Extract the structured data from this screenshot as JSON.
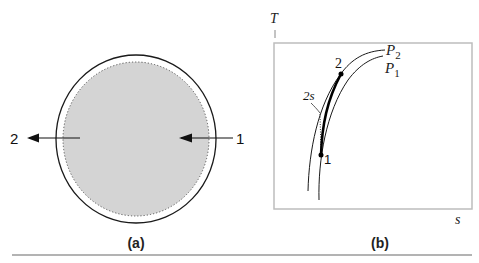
{
  "panel_a": {
    "caption": "(a)",
    "inlet_label": "1",
    "outlet_label": "2",
    "fill_color": "#d4d4d4",
    "stroke_color": "#1a1a1a"
  },
  "panel_b": {
    "caption": "(b)",
    "y_axis_label": "T",
    "x_axis_label": "s",
    "curves": [
      {
        "name": "P2",
        "main": "P",
        "sub": "2"
      },
      {
        "name": "P1",
        "main": "P",
        "sub": "1"
      }
    ],
    "points": [
      {
        "label": "1"
      },
      {
        "label": "2"
      },
      {
        "label": "2s"
      }
    ],
    "frame_color": "#bdbdbd"
  },
  "rule_color": "#9a9a9a"
}
